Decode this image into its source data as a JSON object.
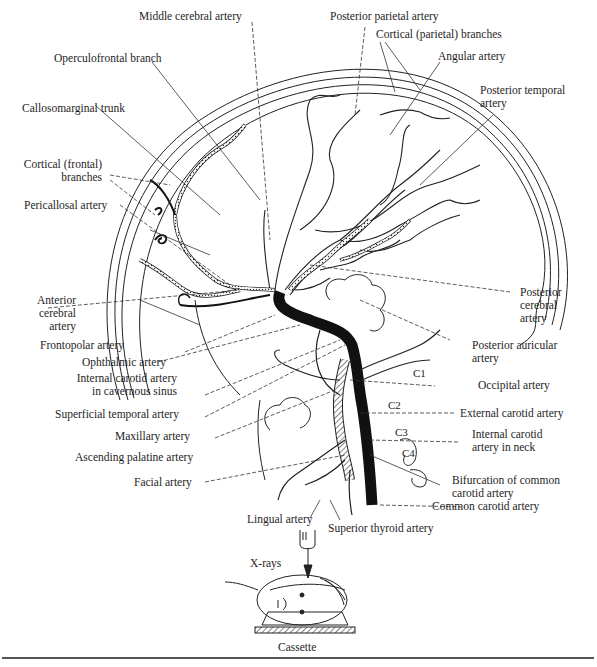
{
  "figure": {
    "labels": {
      "middle_cerebral_artery": "Middle cerebral artery",
      "posterior_parietal_artery": "Posterior parietal artery",
      "cortical_parietal_branches": "Cortical (parietal) branches",
      "operculofrontal_branch": "Operculofrontal branch",
      "angular_artery": "Angular artery",
      "posterior_temporal_artery_1": "Posterior temporal",
      "posterior_temporal_artery_2": "artery",
      "callosomarginal_trunk": "Callosomarginal trunk",
      "cortical_frontal_branches_1": "Cortical (frontal)",
      "cortical_frontal_branches_2": "branches",
      "pericallosal_artery": "Pericallosal artery",
      "anterior_cerebral_artery_1": "Anterior",
      "anterior_cerebral_artery_2": "cerebral",
      "anterior_cerebral_artery_3": "artery",
      "posterior_cerebral_artery_1": "Posterior",
      "posterior_cerebral_artery_2": "cerebral",
      "posterior_cerebral_artery_3": "artery",
      "frontopolar_artery": "Frontopolar artery",
      "ophthalmic_artery": "Ophthalmic artery",
      "posterior_auricular_artery_1": "Posterior auricular",
      "posterior_auricular_artery_2": "artery",
      "internal_carotid_cavernous_1": "Internal carotid artery",
      "internal_carotid_cavernous_2": "in cavernous sinus",
      "occipital_artery": "Occipital artery",
      "superficial_temporal_artery": "Superficial temporal artery",
      "external_carotid_artery": "External carotid artery",
      "maxillary_artery": "Maxillary artery",
      "internal_carotid_neck_1": "Internal carotid",
      "internal_carotid_neck_2": "artery in neck",
      "ascending_palatine_artery": "Ascending palatine artery",
      "bifurcation_1": "Bifurcation of common",
      "bifurcation_2": "carotid artery",
      "facial_artery": "Facial artery",
      "common_carotid_artery": "Common carotid artery",
      "lingual_artery": "Lingual artery",
      "superior_thyroid_artery": "Superior thyroid artery",
      "x_rays": "X-rays",
      "cassette": "Cassette"
    },
    "vertebrae": [
      "C1",
      "C2",
      "C3",
      "C4"
    ]
  }
}
